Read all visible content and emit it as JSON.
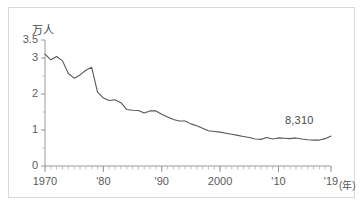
{
  "chart_data": {
    "type": "line",
    "title": "",
    "subtitle": "",
    "xlabel": "(年)",
    "ylabel": "万人",
    "unit_note": "万人",
    "xlim": [
      1970,
      2019
    ],
    "ylim": [
      0,
      3.5
    ],
    "grid": false,
    "legend": false,
    "legend_position": "none",
    "y_ticks": [
      "0",
      "1",
      "2",
      "3",
      "3.5"
    ],
    "y_tick_values": [
      0,
      1,
      2,
      3,
      3.5
    ],
    "x_ticks": [
      "1970",
      "'80",
      "'90",
      "2000",
      "'10",
      "'19"
    ],
    "x_tick_values": [
      1970,
      1980,
      1990,
      2000,
      2010,
      2019
    ],
    "x_minor_tick_interval": 1,
    "line_color": "#55575a",
    "axis_color": "#9a9a9a",
    "series": [
      {
        "name": "交通事故死者数",
        "x": [
          1970,
          1971,
          1972,
          1973,
          1974,
          1975,
          1976,
          1977,
          1978,
          1979,
          1980,
          1981,
          1982,
          1983,
          1984,
          1985,
          1986,
          1987,
          1988,
          1989,
          1990,
          1991,
          1992,
          1993,
          1994,
          1995,
          1996,
          1997,
          1998,
          1999,
          2000,
          2001,
          2002,
          2003,
          2004,
          2005,
          2006,
          2007,
          2008,
          2009,
          2010,
          2011,
          2012,
          2013,
          2014,
          2015,
          2016,
          2017,
          2018,
          2019
        ],
        "values": [
          3.11,
          2.95,
          3.04,
          2.92,
          2.57,
          2.44,
          2.53,
          2.66,
          2.74,
          2.05,
          1.89,
          1.82,
          1.84,
          1.76,
          1.57,
          1.55,
          1.54,
          1.47,
          1.53,
          1.53,
          1.44,
          1.36,
          1.29,
          1.25,
          1.25,
          1.17,
          1.12,
          1.05,
          0.98,
          0.96,
          0.94,
          0.91,
          0.88,
          0.85,
          0.82,
          0.79,
          0.75,
          0.74,
          0.79,
          0.75,
          0.78,
          0.77,
          0.76,
          0.78,
          0.75,
          0.73,
          0.72,
          0.72,
          0.76,
          0.83
        ]
      }
    ],
    "annotations": [
      {
        "name": "final-value-label",
        "text": "8,310",
        "x": 2019,
        "y": 0.831
      }
    ]
  },
  "axis": {
    "unit_label": "万人",
    "x_unit_label": "(年)"
  },
  "ticks": {
    "y": [
      {
        "label": "3.5",
        "value": 3.5
      },
      {
        "label": "3",
        "value": 3
      },
      {
        "label": "2",
        "value": 2
      },
      {
        "label": "1",
        "value": 1
      },
      {
        "label": "0",
        "value": 0
      }
    ],
    "x": [
      {
        "label": "1970",
        "value": 1970
      },
      {
        "label": "'80",
        "value": 1980
      },
      {
        "label": "'90",
        "value": 1990
      },
      {
        "label": "2000",
        "value": 2000
      },
      {
        "label": "'10",
        "value": 2010
      },
      {
        "label": "'19",
        "value": 2019
      }
    ]
  }
}
